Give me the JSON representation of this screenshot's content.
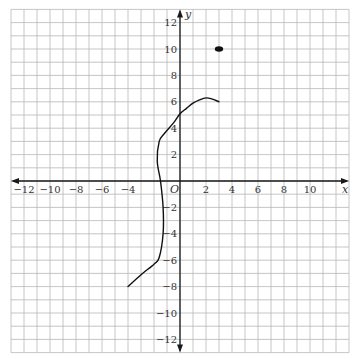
{
  "chart_data": {
    "type": "line",
    "title": "",
    "xlabel": "x",
    "ylabel": "y",
    "origin_label": "O",
    "xlim": [
      -13,
      13
    ],
    "ylim": [
      -13,
      13
    ],
    "grid": true,
    "grid_step": 1,
    "x_ticks": [
      -12,
      -10,
      -8,
      -6,
      -4,
      2,
      4,
      6,
      8,
      10
    ],
    "x_tick_labels": [
      "−12",
      "−10",
      "−8",
      "−6",
      "−4",
      "2",
      "4",
      "6",
      "8",
      "10"
    ],
    "y_ticks": [
      12,
      10,
      8,
      6,
      4,
      2,
      -2,
      -4,
      -6,
      -8,
      -10,
      -12
    ],
    "y_tick_labels": [
      "12",
      "10",
      "8",
      "6",
      "4",
      "2",
      "−2",
      "−4",
      "−6",
      "−8",
      "−10",
      "−12"
    ],
    "series": [
      {
        "name": "curve",
        "type": "line",
        "points": [
          [
            -4,
            -8
          ],
          [
            -3,
            -7.1
          ],
          [
            -2,
            -6.3
          ],
          [
            -1.6,
            -5.8
          ],
          [
            -1.3,
            -4
          ],
          [
            -1.3,
            -2
          ],
          [
            -1.5,
            0
          ],
          [
            -1.75,
            1.5
          ],
          [
            -1.6,
            3
          ],
          [
            -1.2,
            3.6
          ],
          [
            -0.5,
            4.4
          ],
          [
            0,
            5.1
          ],
          [
            0.5,
            5.5
          ],
          [
            1,
            5.9
          ],
          [
            1.5,
            6.15
          ],
          [
            2,
            6.3
          ],
          [
            2.5,
            6.2
          ],
          [
            3,
            6
          ]
        ]
      },
      {
        "name": "isolated point",
        "type": "scatter",
        "points": [
          [
            3,
            10
          ]
        ]
      }
    ]
  },
  "colors": {
    "grid": "#b8b8b8",
    "axis": "#1a1a1a",
    "curve": "#111111",
    "background": "#ffffff"
  }
}
